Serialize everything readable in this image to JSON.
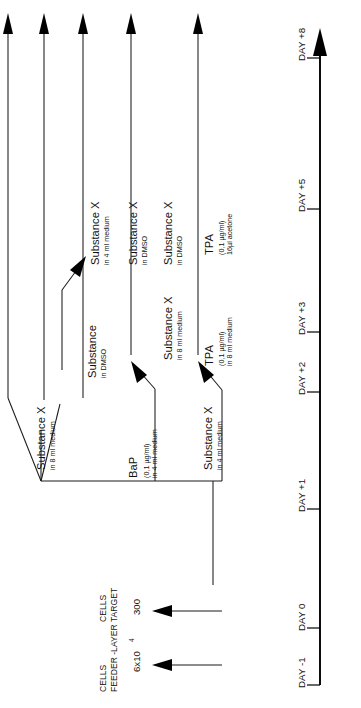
{
  "figure": {
    "kind": "experimental-timeline-diagram",
    "orientation": "rotated-90-ccw",
    "background": "#ffffff",
    "ink": "#000000"
  },
  "timeline": {
    "name": "day-axis",
    "ticks": [
      {
        "label": "DAY -1"
      },
      {
        "label": "DAY 0"
      },
      {
        "label": "DAY +1"
      },
      {
        "label": "DAY +2"
      },
      {
        "label": "DAY +3"
      },
      {
        "label": "DAY +5"
      },
      {
        "label": "DAY +8"
      }
    ]
  },
  "seeding": {
    "feeder": {
      "count": "6x10",
      "exponent": "4",
      "line1": "FEEDER -LAYER",
      "line2": "CELLS"
    },
    "target": {
      "count": "300",
      "line1": "TARGET",
      "line2": "CELLS"
    }
  },
  "treatments": [
    {
      "id": "substance-x-8ml",
      "title": "Substance X",
      "sub1": "in 8 ml medium",
      "sub2": ""
    },
    {
      "id": "substance-dmso-upper",
      "title": "Substance",
      "sub1": "in DMSO",
      "sub2": ""
    },
    {
      "id": "substance-x-dmso-1",
      "title": "Substance X",
      "sub1": "in DMSO",
      "sub2": ""
    },
    {
      "id": "substance-x-4ml-upper",
      "title": "Substance X",
      "sub1": "in 4 ml medium",
      "sub2": ""
    },
    {
      "id": "bap",
      "title": "BaP",
      "sub1": "(0,1 µg/ml)",
      "sub2": "in 4 ml medium"
    },
    {
      "id": "substance-x-8ml-mid",
      "title": "Substance X",
      "sub1": "in 8 ml medium",
      "sub2": ""
    },
    {
      "id": "substance-x-dmso-2",
      "title": "Substance X",
      "sub1": "in DMSO",
      "sub2": ""
    },
    {
      "id": "substance-x-4ml-lower",
      "title": "Substance X",
      "sub1": "in 4 ml medium",
      "sub2": ""
    },
    {
      "id": "tpa-8ml",
      "title": "TPA",
      "sub1": "(0,1 µg/ml)",
      "sub2": "in 8 ml medium"
    },
    {
      "id": "tpa-acetone",
      "title": "TPA",
      "sub1": "(0,1 µg/ml)",
      "sub2": "16µl acetone"
    }
  ]
}
